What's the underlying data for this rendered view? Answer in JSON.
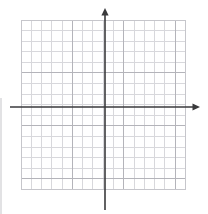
{
  "canvas": {
    "width": 208,
    "height": 214,
    "background": "#ffffff",
    "title": "blank cartesian coordinate grid"
  },
  "chart_data": {
    "type": "scatter",
    "title": "",
    "subtitle": "",
    "xlabel": "",
    "ylabel": "",
    "annotations": [],
    "legend": {
      "entries": [],
      "position": "none"
    },
    "grid": {
      "enabled": true,
      "columns": 16,
      "rows": 16,
      "cell_size_px": 10.3,
      "minor_color": "#d8d8dc",
      "major_color": "#b4b4ba",
      "major_every": 5,
      "border_color": "#c6c6cb",
      "left_px": 21,
      "top_px": 20,
      "right_px": 185.5,
      "bottom_px": 189.5
    },
    "axes": {
      "color": "#3a3a3c",
      "stroke_width": 1.6,
      "origin_px": {
        "x": 105,
        "y": 107
      },
      "x_axis": {
        "start_px": 10,
        "end_px": 200,
        "y_px": 107,
        "arrow_start": false,
        "arrow_end": true
      },
      "y_axis": {
        "start_px": 210,
        "end_px": 8,
        "x_px": 105,
        "arrow_start": false,
        "arrow_end": true
      },
      "xlim": [
        -8,
        8
      ],
      "ylim": [
        -8,
        8
      ],
      "tick_labels_x": [],
      "tick_labels_y": []
    },
    "series": [],
    "x": [],
    "values": []
  },
  "artifacts": {
    "left_edge_line": {
      "x_px": 1,
      "y_start_px": 98,
      "y_end_px": 214,
      "color": "#e2e2e4"
    }
  }
}
